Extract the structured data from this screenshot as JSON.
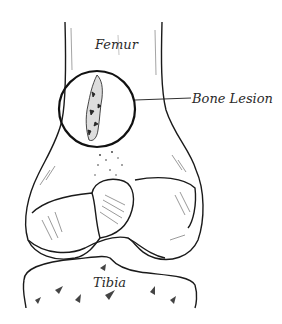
{
  "diagram": {
    "labels": {
      "femur": "Femur",
      "bone_lesion": "Bone Lesion",
      "tibia": "Tibia"
    },
    "colors": {
      "ink": "#1a1a1a",
      "background": "#ffffff",
      "shading": "#555555"
    }
  }
}
